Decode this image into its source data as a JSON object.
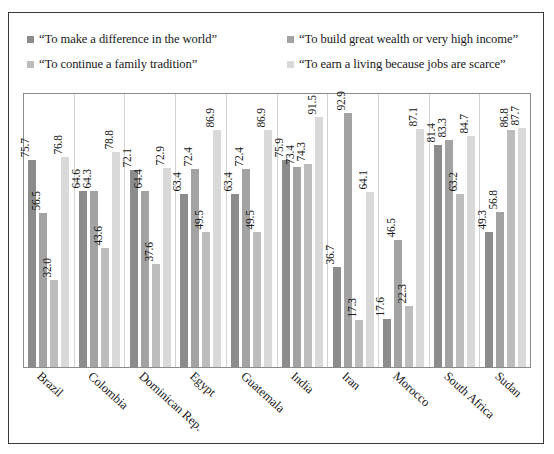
{
  "chart_data": {
    "type": "bar",
    "title": "",
    "subtitle": "",
    "xlabel": "",
    "ylabel": "",
    "ylim": [
      0,
      100
    ],
    "grid": false,
    "legend_position": "top",
    "categories": [
      "Brazil",
      "Colombia",
      "Dominican Rep.",
      "Egypt",
      "Guatemala",
      "India",
      "Iran",
      "Morocco",
      "South Africa",
      "Sudan"
    ],
    "series": [
      {
        "name": "“To make a difference in the world”",
        "color": "#8c8c8c",
        "values": [
          75.7,
          64.6,
          72.1,
          63.4,
          63.4,
          75.9,
          36.7,
          17.6,
          81.4,
          49.3
        ]
      },
      {
        "name": "“To build great wealth or very high income”",
        "color": "#a3a3a3",
        "values": [
          56.5,
          64.3,
          64.4,
          72.4,
          72.4,
          73.4,
          92.9,
          46.5,
          83.3,
          56.8
        ]
      },
      {
        "name": "“To continue a family tradition”",
        "color": "#bdbdbd",
        "values": [
          32.0,
          43.6,
          37.6,
          49.5,
          49.5,
          74.3,
          17.3,
          22.3,
          63.2,
          86.8
        ]
      },
      {
        "name": "“To earn a living because jobs are scarce”",
        "color": "#d9d9d9",
        "values": [
          76.8,
          78.8,
          72.9,
          86.9,
          86.9,
          91.5,
          64.1,
          87.1,
          84.7,
          87.7
        ]
      }
    ]
  },
  "legend": {
    "items": [
      {
        "label": "“To make a difference in the world”",
        "color": "#8c8c8c"
      },
      {
        "label": "“To build great wealth or very high income”",
        "color": "#a3a3a3"
      },
      {
        "label": "“To continue a family tradition”",
        "color": "#bdbdbd"
      },
      {
        "label": "“To earn a living because jobs are scarce”",
        "color": "#d9d9d9"
      }
    ]
  }
}
